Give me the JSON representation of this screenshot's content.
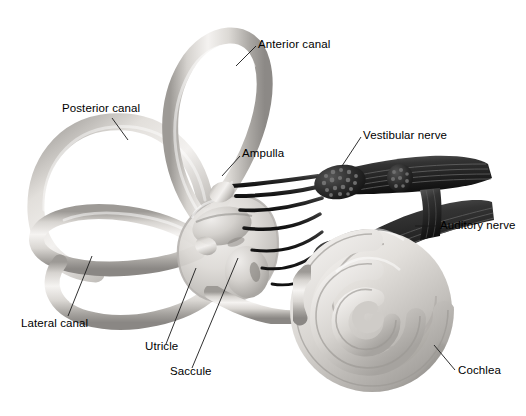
{
  "figure": {
    "background_color": "#ffffff",
    "width": 526,
    "height": 416
  },
  "palette": {
    "membrane_light": "#e9e7e4",
    "membrane_mid": "#c9c6c2",
    "membrane_shadow": "#8e8b88",
    "membrane_highlight": "#f7f6f4",
    "nerve_dark": "#242424",
    "nerve_mid": "#4a4a4a",
    "nerve_highlight": "#7c7c7c",
    "leader_line": "#1a1a1a",
    "label_text": "#000000"
  },
  "labels": [
    {
      "id": "anterior-canal",
      "text": "Anterior canal"
    },
    {
      "id": "posterior-canal",
      "text": "Posterior canal"
    },
    {
      "id": "ampulla",
      "text": "Ampulla"
    },
    {
      "id": "vestibular-nerve",
      "text": "Vestibular nerve"
    },
    {
      "id": "auditory-nerve",
      "text": "Auditory nerve"
    },
    {
      "id": "lateral-canal",
      "text": "Lateral canal"
    },
    {
      "id": "utricle",
      "text": "Utricle"
    },
    {
      "id": "saccule",
      "text": "Saccule"
    },
    {
      "id": "cochlea",
      "text": "Cochlea"
    }
  ],
  "structures": [
    "anterior semicircular canal",
    "posterior semicircular canal",
    "lateral semicircular canal",
    "ampulla",
    "vestibule",
    "utricle",
    "saccule",
    "vestibular nerve",
    "auditory nerve",
    "cochlea"
  ],
  "caption_ghost": ""
}
